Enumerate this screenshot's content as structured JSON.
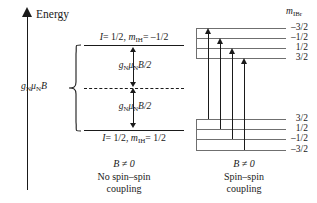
{
  "figure": {
    "type": "nuclear-spin-energy-level-diagram",
    "axis": {
      "label": "Energy",
      "direction": "up"
    },
    "left_panel": {
      "caption_field": "B ≠ 0",
      "caption_line1": "No spin–spin",
      "caption_line2": "coupling",
      "upper_level_label": "I = 1/2, mₗₕ = –1/2",
      "lower_level_label": "I = 1/2, mₗₕ = 1/2",
      "upper_level_label_parts": {
        "spin": "I",
        "spin_value": "= 1/2,",
        "m_symbol": "m",
        "m_subscript": "IH",
        "m_value": "= –1/2"
      },
      "lower_level_label_parts": {
        "spin": "I",
        "spin_value": "= 1/2,",
        "m_symbol": "m",
        "m_subscript": "IH",
        "m_value": "= 1/2"
      },
      "split_label_upper": "gₙμₙB/2",
      "split_label_lower": "gₙμₙB/2",
      "split_label_parts": {
        "g": "g",
        "g_sub": "N",
        "mu": "μ",
        "mu_sub": "N",
        "b": "B/2"
      },
      "brace_label": "gₙμₙB",
      "brace_label_parts": {
        "g": "g",
        "g_sub": "N",
        "mu": "μ",
        "mu_sub": "N",
        "b": "B"
      }
    },
    "right_panel": {
      "caption_field": "B ≠ 0",
      "caption_line1": "Spin–spin",
      "caption_line2": "coupling",
      "m_header_symbol": "m",
      "m_header_subscript": "IBr",
      "upper_levels": [
        "–3/2",
        "–1/2",
        "1/2",
        "3/2"
      ],
      "lower_levels": [
        "3/2",
        "1/2",
        "–1/2",
        "–3/2"
      ],
      "transition_count": 4
    },
    "colors": {
      "ink": "#1a1a1a",
      "level_gray": "#6f6f6f",
      "background": "#ffffff"
    }
  }
}
